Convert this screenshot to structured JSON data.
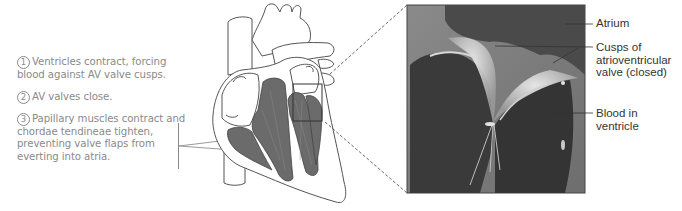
{
  "steps": [
    {
      "number": "1",
      "text": "Ventricles contract, forcing blood against AV valve cusps."
    },
    {
      "number": "2",
      "text": "AV valves close."
    },
    {
      "number": "3",
      "text": "Papillary muscles contract and chordae tendineae tighten, preventing valve flaps from everting into atria."
    }
  ],
  "inset_labels": {
    "atrium": "Atrium",
    "cusps": "Cusps of atrioventricular valve (closed)",
    "cusps_lines": [
      "Cusps of",
      "atrioventricular",
      "valve (closed)"
    ],
    "blood": "Blood in ventricle",
    "blood_lines": [
      "Blood in",
      "ventricle"
    ]
  },
  "colors": {
    "text_gray": "#8a8a8a",
    "outline": "#555555",
    "muscle": "#6b6b6b",
    "inset_dark": "#3a3a3a"
  }
}
